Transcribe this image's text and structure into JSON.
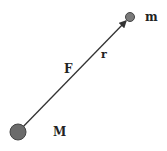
{
  "diagram": {
    "title": "",
    "nodes": [
      {
        "id": "M",
        "label": "M",
        "cx": 18,
        "cy": 132,
        "r": 8,
        "fill": "#6b6b6b"
      },
      {
        "id": "m",
        "label": "m",
        "cx": 130,
        "cy": 17,
        "r": 4.5,
        "fill": "#7a7a7a"
      }
    ],
    "edge": {
      "from": "M",
      "to": "m",
      "arrow": "end",
      "color": "#333333"
    },
    "labels": {
      "force": "F",
      "distance": "r",
      "small_mass": "m",
      "large_mass": "M"
    }
  }
}
